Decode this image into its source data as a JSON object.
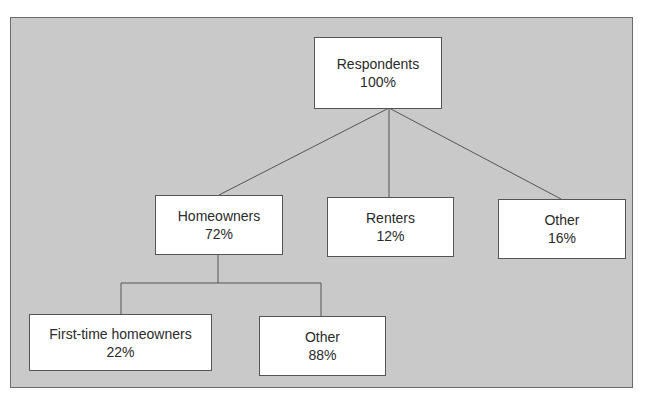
{
  "diagram": {
    "type": "tree",
    "colors": {
      "background": "#c9c9c9",
      "node_fill": "#ffffff",
      "border": "#555555",
      "text": "#2a2a2a"
    },
    "root": {
      "label": "Respondents",
      "value": "100%",
      "children": [
        {
          "label": "Homeowners",
          "value": "72%",
          "children": [
            {
              "label": "First-time homeowners",
              "value": "22%"
            },
            {
              "label": "Other",
              "value": "88%"
            }
          ]
        },
        {
          "label": "Renters",
          "value": "12%"
        },
        {
          "label": "Other",
          "value": "16%"
        }
      ]
    }
  }
}
